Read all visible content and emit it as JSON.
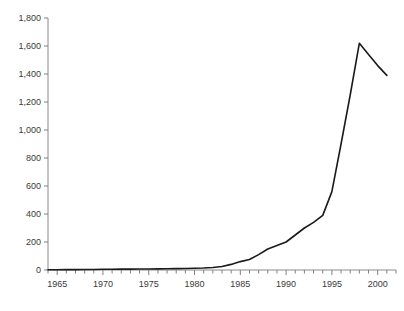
{
  "chart_data": {
    "type": "line",
    "title": "",
    "subtitle": "",
    "xlabel": "",
    "ylabel": "",
    "xlim": [
      1964,
      2002
    ],
    "ylim": [
      0,
      1800
    ],
    "grid": false,
    "legend": null,
    "legend_position": "none",
    "axis_color": "#808080",
    "line_color": "#1a1a1a",
    "line_width": 1.6,
    "y_ticks": [
      0,
      200,
      400,
      600,
      800,
      1000,
      1200,
      1400,
      1600,
      1800
    ],
    "y_tick_labels": [
      "0",
      "200",
      "400",
      "600",
      "800",
      "1,000",
      "1,200",
      "1,400",
      "1,600",
      "1,800"
    ],
    "x_ticks_major": [
      1965,
      1970,
      1975,
      1980,
      1985,
      1990,
      1995,
      2000
    ],
    "x_tick_labels": [
      "1965",
      "1970",
      "1975",
      "1980",
      "1985",
      "1990",
      "1995",
      "2000"
    ],
    "x_minor_tick_step": 1,
    "x": [
      1964,
      1965,
      1966,
      1967,
      1968,
      1969,
      1970,
      1971,
      1972,
      1973,
      1974,
      1975,
      1976,
      1977,
      1978,
      1979,
      1980,
      1981,
      1982,
      1983,
      1984,
      1985,
      1986,
      1987,
      1988,
      1989,
      1990,
      1991,
      1992,
      1993,
      1994,
      1995,
      1996,
      1997,
      1998,
      1999,
      2000,
      2001
    ],
    "values": [
      2,
      2,
      3,
      3,
      4,
      4,
      5,
      5,
      6,
      6,
      7,
      7,
      8,
      9,
      10,
      11,
      12,
      14,
      18,
      25,
      40,
      60,
      75,
      110,
      150,
      175,
      200,
      250,
      300,
      340,
      390,
      560,
      900,
      1250,
      1620,
      1540,
      1460,
      1390
    ],
    "series": [
      {
        "name": "series-1",
        "values": [
          2,
          2,
          3,
          3,
          4,
          4,
          5,
          5,
          6,
          6,
          7,
          7,
          8,
          9,
          10,
          11,
          12,
          14,
          18,
          25,
          40,
          60,
          75,
          110,
          150,
          175,
          200,
          250,
          300,
          340,
          390,
          560,
          900,
          1250,
          1620,
          1540,
          1460,
          1390
        ]
      }
    ],
    "annotations": {
      "peak_year": 1998,
      "peak_value": 1620,
      "end_year": 2001,
      "end_value": 1390
    }
  }
}
